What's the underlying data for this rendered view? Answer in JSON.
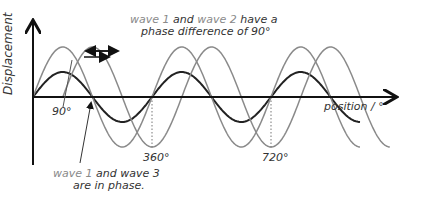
{
  "axes": {
    "y_label": "Displacement",
    "x_label": "position / °",
    "ticks": [
      {
        "label": "90°",
        "value": 90
      },
      {
        "label": "360°",
        "value": 360
      },
      {
        "label": "720°",
        "value": 720
      }
    ]
  },
  "annotations": {
    "top": {
      "part1": "wave 1",
      "part2": " and ",
      "part3": "wave 2",
      "part4": " have a",
      "line2": "phase difference of 90°"
    },
    "bottom": {
      "part1": "wave 1",
      "part2": " and wave 3",
      "line2": "are in phase."
    }
  },
  "colors": {
    "wave1": "#222222",
    "wave2": "#8a8a8a",
    "wave3": "#8a8a8a",
    "axis": "#111111"
  },
  "chart_data": {
    "type": "line",
    "title": "",
    "xlabel": "position / °",
    "ylabel": "Displacement",
    "xlim": [
      0,
      900
    ],
    "series": [
      {
        "name": "wave 1",
        "amplitude": 1,
        "phase_deg": 0,
        "color": "#222222"
      },
      {
        "name": "wave 2",
        "amplitude": 2,
        "phase_deg": -90,
        "color": "#8a8a8a"
      },
      {
        "name": "wave 3",
        "amplitude": 2,
        "phase_deg": 0,
        "color": "#8a8a8a"
      }
    ],
    "annotations": [
      "wave 1 and wave 2 have a phase difference of 90°",
      "wave 1 and wave 3 are in phase."
    ]
  }
}
